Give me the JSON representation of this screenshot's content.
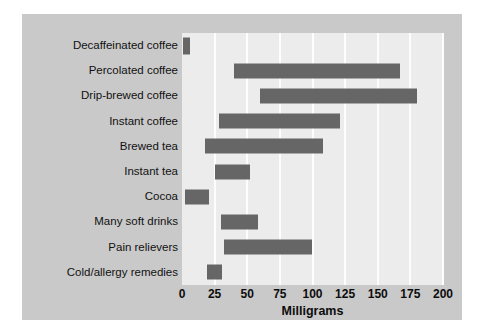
{
  "chart_data": {
    "type": "bar",
    "orientation": "horizontal",
    "bar_style": "range",
    "title": "",
    "subtitle": "",
    "xlabel": "Milligrams",
    "ylabel": "",
    "xlim": [
      0,
      200
    ],
    "xticks": [
      0,
      25,
      50,
      75,
      100,
      125,
      150,
      175,
      200
    ],
    "xtick_labels": [
      "0",
      "25",
      "50",
      "75",
      "100",
      "125",
      "150",
      "175",
      "200"
    ],
    "grid": "vertical",
    "legend": "none",
    "annotations": [],
    "categories": [
      "Decaffeinated coffee",
      "Percolated coffee",
      "Drip-brewed coffee",
      "Instant coffee",
      "Brewed tea",
      "Instant tea",
      "Cocoa",
      "Many soft drinks",
      "Pain relievers",
      "Cold/allergy remedies"
    ],
    "ranges": [
      {
        "category": "Decaffeinated coffee",
        "start": 1,
        "end": 6
      },
      {
        "category": "Percolated coffee",
        "start": 40,
        "end": 167
      },
      {
        "category": "Drip-brewed coffee",
        "start": 60,
        "end": 180
      },
      {
        "category": "Instant coffee",
        "start": 28,
        "end": 121
      },
      {
        "category": "Brewed tea",
        "start": 18,
        "end": 108
      },
      {
        "category": "Instant tea",
        "start": 25,
        "end": 52
      },
      {
        "category": "Cocoa",
        "start": 2,
        "end": 21
      },
      {
        "category": "Many soft drinks",
        "start": 30,
        "end": 58
      },
      {
        "category": "Pain relievers",
        "start": 32,
        "end": 100
      },
      {
        "category": "Cold/allergy remedies",
        "start": 19,
        "end": 31
      }
    ]
  },
  "colors": {
    "page_background": "#ffffff",
    "panel_background": "#c9c9c9",
    "plot_background": "#ececec",
    "gridline": "#fdfdfd",
    "bar_fill": "#666666",
    "text": "#111111"
  }
}
